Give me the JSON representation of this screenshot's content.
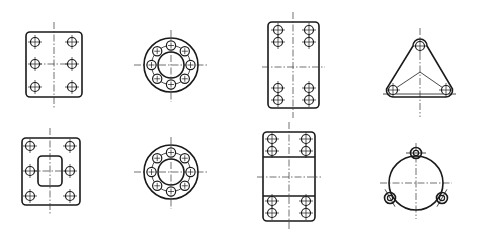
{
  "figure": {
    "title": "",
    "colors": {
      "background": "#ffffff",
      "line": "#1a1a1a"
    },
    "panels": [
      {
        "id": "rect-plate-6-holes",
        "shape": "rounded-rectangle",
        "holes": 6,
        "hole_layout": "2 columns x 3 rows"
      },
      {
        "id": "ring-flange-8-holes",
        "shape": "annular-flange",
        "holes": 8,
        "hole_layout": "bolt circle, 8 equally spaced"
      },
      {
        "id": "rect-plate-8-holes",
        "shape": "rounded-rectangle",
        "holes": 8,
        "hole_layout": "2 columns x 2 pairs (top and bottom)"
      },
      {
        "id": "triangular-flange-3-holes",
        "shape": "rounded-triangle",
        "holes": 3,
        "hole_layout": "3 corners"
      },
      {
        "id": "plate-with-window-6-holes",
        "shape": "rounded-rectangle with central rectangular opening",
        "holes": 6,
        "hole_layout": "2 columns x 3 rows"
      },
      {
        "id": "ring-flange-8-holes-b",
        "shape": "annular-flange",
        "holes": 8,
        "hole_layout": "bolt circle, 8 equally spaced"
      },
      {
        "id": "split-block-8-holes",
        "shape": "rounded-rectangle in three sections",
        "holes": 8,
        "hole_layout": "2 columns x 2 pairs (top and bottom sections)"
      },
      {
        "id": "round-flange-3-lugs",
        "shape": "circle with three lugs",
        "holes": 3,
        "hole_layout": "3 lugs at 120 degrees"
      }
    ]
  }
}
